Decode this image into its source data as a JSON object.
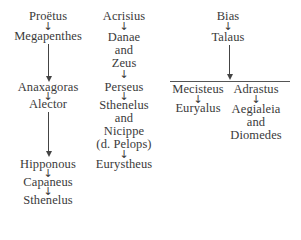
{
  "diagram": {
    "type": "genealogy",
    "arrow_glyph": "↓",
    "columns": [
      {
        "name": "proetus-line",
        "nodes": [
          "Proëtus",
          "Megapenthes",
          "Anaxagoras",
          "Alector",
          "Hipponous",
          "Capaneus",
          "Sthenelus"
        ]
      },
      {
        "name": "acrisius-line",
        "nodes": [
          "Acrisius",
          "Danae",
          "and",
          "Zeus",
          "Perseus",
          "Sthenelus",
          "and",
          "Nicippe",
          "(d. Pelops)",
          "Eurystheus"
        ]
      },
      {
        "name": "bias-line",
        "nodes": [
          "Bias",
          "Talaus"
        ],
        "branches": [
          {
            "nodes": [
              "Mecisteus",
              "Euryalus"
            ]
          },
          {
            "nodes": [
              "Adrastus",
              "Aegialeia",
              "and",
              "Diomedes"
            ]
          }
        ]
      }
    ]
  }
}
